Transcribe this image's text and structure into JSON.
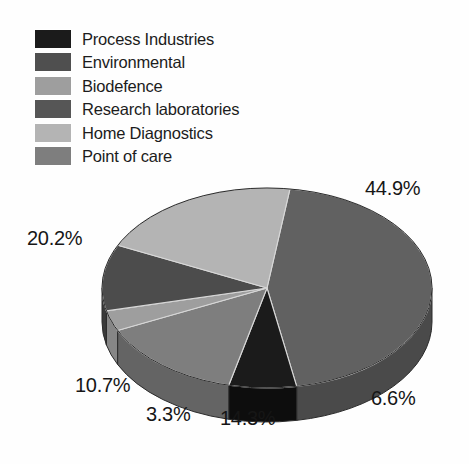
{
  "chart_data": {
    "type": "pie",
    "title": "",
    "subtitle": "",
    "xlabel": "",
    "ylabel": "",
    "legend_position": "top-left",
    "three_d": true,
    "grid": false,
    "categories": [
      "Process Industries",
      "Environmental",
      "Biodefence",
      "Research laboratories",
      "Home Diagnostics",
      "Point of care"
    ],
    "values": [
      6.6,
      44.9,
      3.3,
      10.7,
      20.2,
      14.3
    ],
    "value_labels": [
      "6.6%",
      "44.9%",
      "3.3%",
      "10.7%",
      "20.2%",
      "14.3%"
    ],
    "unit": "%",
    "colors": [
      "#1b1b1b",
      "#616161",
      "#9e9e9e",
      "#4c4c4c",
      "#b4b4b4",
      "#7e7e7e"
    ],
    "slices": [
      {
        "label": "Process Industries",
        "value": 6.6,
        "value_label": "6.6%",
        "color": "#1b1b1b",
        "side_color": "#0d0d0d"
      },
      {
        "label": "Environmental",
        "value": 44.9,
        "value_label": "44.9%",
        "color": "#616161",
        "side_color": "#4a4a4a"
      },
      {
        "label": "Biodefence",
        "value": 3.3,
        "value_label": "3.3%",
        "color": "#9e9e9e",
        "side_color": "#868686"
      },
      {
        "label": "Research laboratories",
        "value": 10.7,
        "value_label": "10.7%",
        "color": "#4c4c4c",
        "side_color": "#3a3a3a"
      },
      {
        "label": "Home Diagnostics",
        "value": 20.2,
        "value_label": "20.2%",
        "color": "#b4b4b4",
        "side_color": "#9a9a9a"
      },
      {
        "label": "Point of care",
        "value": 14.3,
        "value_label": "14.3%",
        "color": "#7e7e7e",
        "side_color": "#646464"
      }
    ]
  },
  "legend": {
    "items": [
      {
        "label": "Process Industries",
        "color": "#1b1b1b"
      },
      {
        "label": "Environmental",
        "color": "#4f4f4f"
      },
      {
        "label": "Biodefence",
        "color": "#9e9e9e"
      },
      {
        "label": "Research laboratories",
        "color": "#565656"
      },
      {
        "label": "Home Diagnostics",
        "color": "#b4b4b4"
      },
      {
        "label": "Point of care",
        "color": "#7e7e7e"
      }
    ]
  }
}
